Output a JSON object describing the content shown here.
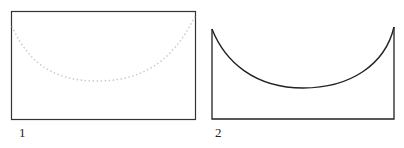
{
  "figures": [
    {
      "label": "1",
      "shape": "rectangle with dotted semicircular arc",
      "stroke": "#333333",
      "arc_color": "#cccccc"
    },
    {
      "label": "2",
      "shape": "U-shaped region bounded by concave arc",
      "stroke": "#222222"
    }
  ]
}
